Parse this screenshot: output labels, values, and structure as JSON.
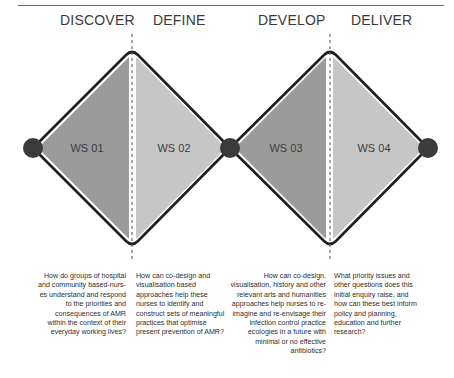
{
  "phases": [
    {
      "label": "DISCOVER"
    },
    {
      "label": "DEFINE"
    },
    {
      "label": "DEVELOP"
    },
    {
      "label": "DELIVER"
    }
  ],
  "workshops": [
    {
      "label": "WS 01"
    },
    {
      "label": "WS 02"
    },
    {
      "label": "WS 03"
    },
    {
      "label": "WS 04"
    }
  ],
  "questions": [
    {
      "text": "How do groups of hospital and community based-nurs-es understand and respond to the priorities and consequences of AMR within the context of their everyday working lives?"
    },
    {
      "text": "How can co-design and visualisation based approaches help these nurses to identify and construct sets of meaningful practices that optimise present prevention of AMR?"
    },
    {
      "text": "How can co-design, visualisation, history and other relevant arts and humanities approaches help nurses to re-imagine and re-envisage their infection control practice ecologies in a future with minimal or no effective antibiotics?"
    },
    {
      "text": "What priority issues and other questions does this initial enquiry raise, and how can these best inform policy and planning, education and further research?"
    }
  ],
  "colors": {
    "dark_fill": "#9b9b9b",
    "light_fill": "#c6c6c6",
    "outline": "#1f1f1f",
    "node": "#3b3b3b",
    "divider": "#555555"
  }
}
